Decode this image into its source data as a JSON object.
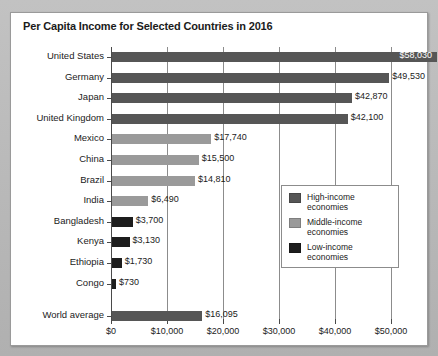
{
  "chart_data": {
    "type": "bar",
    "orientation": "horizontal",
    "title": "Per Capita Income for Selected Countries in 2016",
    "xlabel": "",
    "ylabel": "",
    "xlim": [
      0,
      55000
    ],
    "grid": true,
    "axis_ticks": [
      {
        "value": 0,
        "label": "$0"
      },
      {
        "value": 10000,
        "label": "$10,000"
      },
      {
        "value": 20000,
        "label": "$20,000"
      },
      {
        "value": 30000,
        "label": "$30,000"
      },
      {
        "value": 40000,
        "label": "$40,000"
      },
      {
        "value": 50000,
        "label": "$50,000"
      }
    ],
    "categories": [
      "United States",
      "Germany",
      "Japan",
      "United Kingdom",
      "Mexico",
      "China",
      "Brazil",
      "India",
      "Bangladesh",
      "Kenya",
      "Ethiopia",
      "Congo",
      "World average"
    ],
    "values": [
      58030,
      49530,
      42870,
      42100,
      17740,
      15500,
      14810,
      6490,
      3700,
      3130,
      1730,
      730,
      16095
    ],
    "value_labels": [
      "$58,030",
      "$49,530",
      "$42,870",
      "$42,100",
      "$17,740",
      "$15,500",
      "$14,810",
      "$6,490",
      "$3,700",
      "$3,130",
      "$1,730",
      "$730",
      "$16,095"
    ],
    "groups": [
      "high",
      "high",
      "high",
      "high",
      "middle",
      "middle",
      "middle",
      "middle",
      "low",
      "low",
      "low",
      "low",
      "high"
    ],
    "label_position": [
      "inside",
      "outside",
      "outside",
      "outside",
      "outside",
      "outside",
      "outside",
      "outside",
      "outside",
      "outside",
      "outside",
      "outside",
      "outside"
    ],
    "legend": {
      "position": "center-right",
      "entries": [
        {
          "key": "high",
          "label": "High-income economies",
          "color": "#565656"
        },
        {
          "key": "middle",
          "label": "Middle-income economies",
          "color": "#9a9a9a"
        },
        {
          "key": "low",
          "label": "Low-income economies",
          "color": "#1d1d1d"
        }
      ]
    },
    "colors": {
      "high": "#565656",
      "middle": "#9a9a9a",
      "low": "#1d1d1d",
      "panel_background": "#ffffff",
      "page_background": "#b5b5b5",
      "axis": "#4a4a4a",
      "gridline": "#8c8c8c",
      "text": "#1b1b1b"
    }
  }
}
